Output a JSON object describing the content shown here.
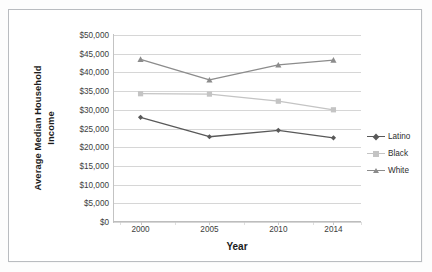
{
  "chart_data": {
    "type": "line",
    "title": "",
    "xlabel": "Year",
    "ylabel": "Average Median Household Income",
    "ylabel_line1": "Average Median Household",
    "ylabel_line2": "Income",
    "categories": [
      "2000",
      "2005",
      "2010",
      "2014"
    ],
    "x": [
      2000,
      2005,
      2010,
      2014
    ],
    "ylim": [
      0,
      50000
    ],
    "xlim": [
      1998,
      2016
    ],
    "y_ticks": [
      0,
      5000,
      10000,
      15000,
      20000,
      25000,
      30000,
      35000,
      40000,
      45000,
      50000
    ],
    "y_tick_labels": [
      "$0",
      "$5,000",
      "$10,000",
      "$15,000",
      "$20,000",
      "$25,000",
      "$30,000",
      "$35,000",
      "$40,000",
      "$45,000",
      "$50,000"
    ],
    "x_tick_labels": [
      "2000",
      "2005",
      "2010",
      "2014"
    ],
    "grid": true,
    "grid_axis": "y",
    "legend_position": "right",
    "series": [
      {
        "name": "Latino",
        "color": "#595959",
        "marker": "diamond",
        "values": [
          28000,
          22800,
          24500,
          22500
        ]
      },
      {
        "name": "Black",
        "color": "#c4c4c4",
        "marker": "square",
        "values": [
          34300,
          34200,
          32300,
          30000
        ]
      },
      {
        "name": "White",
        "color": "#8c8c8c",
        "marker": "triangle",
        "values": [
          43500,
          38000,
          42000,
          43300
        ]
      }
    ]
  },
  "legend": {
    "entries": [
      {
        "label": "Latino"
      },
      {
        "label": "Black"
      },
      {
        "label": "White"
      }
    ]
  },
  "colors": {
    "latino": "#595959",
    "black": "#c4c4c4",
    "white": "#8c8c8c",
    "gridline": "#d6d6d6",
    "border": "#b9bcc0",
    "text": "#3d3d3d"
  }
}
